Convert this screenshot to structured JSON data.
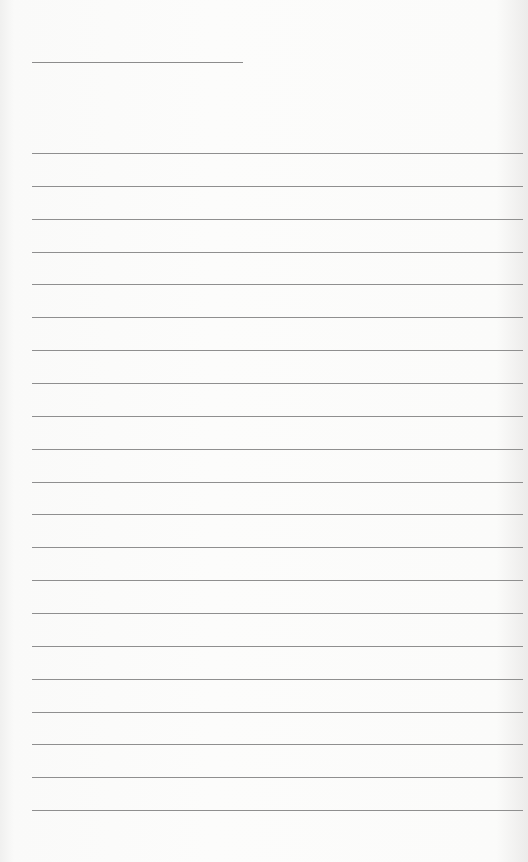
{
  "document": {
    "type": "blank lined paper",
    "title_line": {
      "text": ""
    },
    "ruled_lines": [
      {
        "text": ""
      },
      {
        "text": ""
      },
      {
        "text": ""
      },
      {
        "text": ""
      },
      {
        "text": ""
      },
      {
        "text": ""
      },
      {
        "text": ""
      },
      {
        "text": ""
      },
      {
        "text": ""
      },
      {
        "text": ""
      },
      {
        "text": ""
      },
      {
        "text": ""
      },
      {
        "text": ""
      },
      {
        "text": ""
      },
      {
        "text": ""
      },
      {
        "text": ""
      },
      {
        "text": ""
      },
      {
        "text": ""
      },
      {
        "text": ""
      },
      {
        "text": ""
      },
      {
        "text": ""
      }
    ],
    "colors": {
      "paper": "#fbfbfa",
      "rule": "#8f8f8f"
    }
  }
}
